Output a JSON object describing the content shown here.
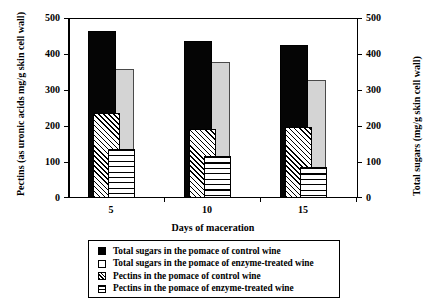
{
  "chart_data": {
    "type": "bar",
    "title": "",
    "categories": [
      "5",
      "10",
      "15"
    ],
    "xlabel": "Days of maceration",
    "ylabel": "Pectins (as uronic acids mg/g skin cell wall)",
    "ylabel_secondary": "Total sugars (mg/g skin cell wall)",
    "ylim": [
      0,
      500
    ],
    "ylim_secondary": [
      0,
      500
    ],
    "yticks": [
      "0",
      "100",
      "200",
      "300",
      "400",
      "500"
    ],
    "yticks_secondary": [
      "0",
      "100",
      "200",
      "300",
      "400",
      "500"
    ],
    "grid": false,
    "legend_position": "bottom",
    "series": [
      {
        "name": "Total sugars in the pomace of control wine",
        "axis": "right",
        "pattern": "solid-black",
        "color": "#050505",
        "values": [
          465,
          436,
          424
        ]
      },
      {
        "name": "Total sugars in the pomace of enzyme-treated wine",
        "axis": "right",
        "pattern": "light-gray-outlined",
        "color": "#d4d4d4",
        "values": [
          358,
          378,
          328
        ]
      },
      {
        "name": "Pectins in the pomace of control wine",
        "axis": "left",
        "pattern": "diagonal-hatch",
        "color": "#ffffff",
        "values": [
          236,
          192,
          197
        ]
      },
      {
        "name": "Pectins in the pomace of enzyme-treated wine",
        "axis": "left",
        "pattern": "horizontal-lines",
        "color": "#ffffff",
        "values": [
          135,
          116,
          87
        ]
      }
    ]
  }
}
